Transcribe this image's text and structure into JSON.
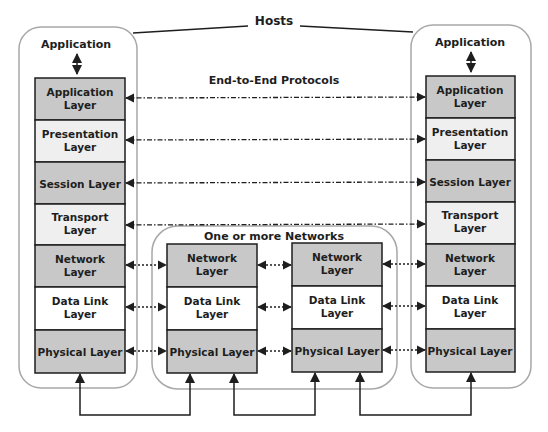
{
  "title": "Hosts",
  "end_to_end_label": "End-to-End Protocols",
  "networks_label": "One or more Networks",
  "colors": {
    "dark_layer": "#c8c8c8",
    "light_layer": "#efefef",
    "white_layer": "#ffffff",
    "container_border": "#a8a8a8",
    "line": "#1e1e1e"
  },
  "left_host": {
    "app_label": "Application",
    "layers": [
      {
        "line1": "Application",
        "line2": "Layer"
      },
      {
        "line1": "Presentation",
        "line2": "Layer"
      },
      {
        "line1": "Session Layer",
        "line2": ""
      },
      {
        "line1": "Transport",
        "line2": "Layer"
      },
      {
        "line1": "Network",
        "line2": "Layer"
      },
      {
        "line1": "Data Link",
        "line2": "Layer"
      },
      {
        "line1": "Physical Layer",
        "line2": ""
      }
    ]
  },
  "right_host": {
    "app_label": "Application",
    "layers": [
      {
        "line1": "Application",
        "line2": "Layer"
      },
      {
        "line1": "Presentation",
        "line2": "Layer"
      },
      {
        "line1": "Session Layer",
        "line2": ""
      },
      {
        "line1": "Transport",
        "line2": "Layer"
      },
      {
        "line1": "Network",
        "line2": "Layer"
      },
      {
        "line1": "Data Link",
        "line2": "Layer"
      },
      {
        "line1": "Physical Layer",
        "line2": ""
      }
    ]
  },
  "router1": {
    "layers": [
      {
        "line1": "Network",
        "line2": "Layer"
      },
      {
        "line1": "Data Link",
        "line2": "Layer"
      },
      {
        "line1": "Physical Layer",
        "line2": ""
      }
    ]
  },
  "router2": {
    "layers": [
      {
        "line1": "Network",
        "line2": "Layer"
      },
      {
        "line1": "Data Link",
        "line2": "Layer"
      },
      {
        "line1": "Physical Layer",
        "line2": ""
      }
    ]
  }
}
